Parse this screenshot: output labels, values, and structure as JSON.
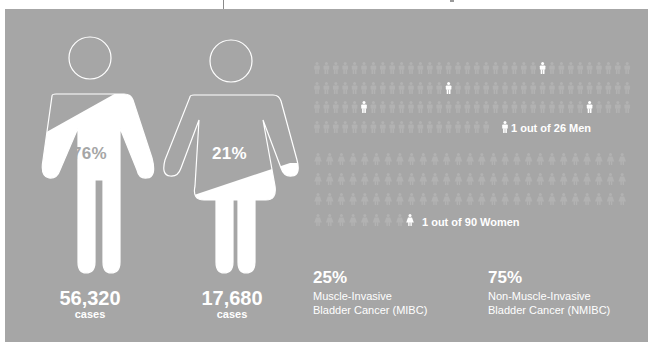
{
  "colors": {
    "panel": "#a6a6a6",
    "faint_figure": "#b2b2b2",
    "highlight": "#ffffff"
  },
  "men": {
    "percent": "76%",
    "count": "56,320",
    "count_label": "cases",
    "icon": "male-figure-icon"
  },
  "women": {
    "percent": "21%",
    "count": "17,680",
    "count_label": "cases",
    "icon": "female-figure-icon"
  },
  "ratios": {
    "men": {
      "label": "1 out of 26 Men",
      "rows": 4,
      "cols": 34
    },
    "women": {
      "label": "1 out of 90 Women",
      "rows": 4,
      "cols": 27
    }
  },
  "stats": [
    {
      "percent": "25%",
      "line1": "Muscle-Invasive",
      "line2": "Bladder Cancer (MIBC)"
    },
    {
      "percent": "75%",
      "line1": "Non-Muscle-Invasive",
      "line2": "Bladder Cancer (NMIBC)"
    }
  ]
}
